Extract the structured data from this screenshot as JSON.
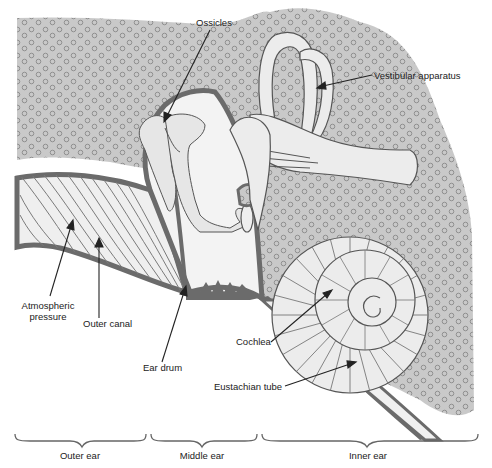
{
  "diagram": {
    "labels": {
      "ossicles": "Ossicles",
      "vestibular": "Vestibular apparatus",
      "atmospheric_1": "Atmospheric",
      "atmospheric_2": "pressure",
      "outer_canal": "Outer canal",
      "ear_drum": "Ear drum",
      "cochlea": "Cochlea",
      "eustachian": "Eustachian tube"
    },
    "regions": [
      {
        "label": "Outer ear"
      },
      {
        "label": "Middle ear"
      },
      {
        "label": "Inner ear"
      }
    ],
    "colors": {
      "bone_fill": "#c8c8c8",
      "bone_dots": "#8a8a8a",
      "membrane": "#6e6e6e",
      "cavity": "#f2f2f2",
      "line": "#444444"
    }
  }
}
